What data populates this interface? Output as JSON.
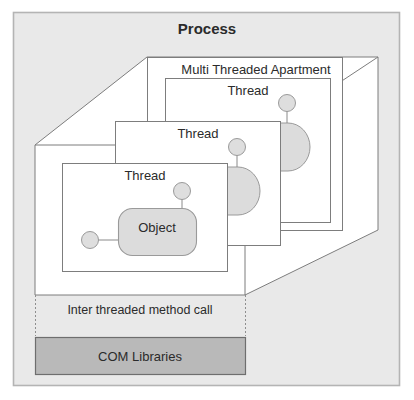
{
  "diagram": {
    "type": "com-threading-model",
    "title": "Process",
    "outer_frame": {
      "fill": "#e9e9e9",
      "stroke": "#b0b0b0"
    },
    "apartment": {
      "label": "Multi Threaded Apartment"
    },
    "threads": [
      {
        "label": "Thread",
        "depth": "back"
      },
      {
        "label": "Thread",
        "depth": "middle"
      },
      {
        "label": "Thread",
        "depth": "front"
      }
    ],
    "object": {
      "label": "Object",
      "fill": "#e0e0e0",
      "stroke": "#8d8d8d"
    },
    "inter_thread": {
      "label": "Inter threaded method call",
      "border_style": "dotted"
    },
    "com_libraries": {
      "label": "COM Libraries",
      "fill": "#b9b9b9",
      "stroke": "#6e6e6e"
    },
    "colors": {
      "background": "#ffffff",
      "process_fill": "#e9e9e9",
      "panel_fill": "#ffffff",
      "line": "#808080",
      "text": "#2b2b2b",
      "lollipop_fill": "#e0e0e0"
    }
  }
}
